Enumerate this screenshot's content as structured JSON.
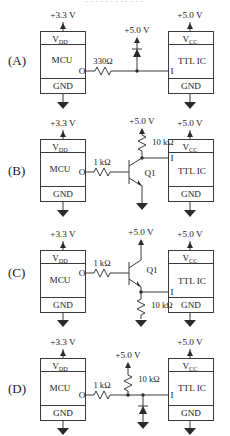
{
  "page": {
    "top_cut_text": "············",
    "background": "#ffffff",
    "ink": "#2a2a2a"
  },
  "labels": {
    "mcu": "MCU",
    "ttl": "TTL IC",
    "vdd": "V",
    "vdd_sub": "DD",
    "vcc": "V",
    "vcc_sub": "CC",
    "gnd": "GND",
    "out_pin": "O",
    "in_pin": "I",
    "v33": "+3.3 V",
    "v50": "+5.0 V",
    "q1": "Q1",
    "r330": "330Ω",
    "r1k": "1 kΩ",
    "r10k": "10 kΩ"
  },
  "circuits": [
    {
      "id": "A",
      "tag": "(A)",
      "mcu_supply": "+3.3 V",
      "mid_supply": "+5.0 V",
      "ttl_supply": "+5.0 V",
      "components": [
        "330Ω series resistor",
        "clamp diode to +5.0 V"
      ],
      "series_resistor": "330Ω",
      "pullup_resistor": "",
      "has_transistor": false,
      "has_diode": true,
      "diode_direction": "up"
    },
    {
      "id": "B",
      "tag": "(B)",
      "mcu_supply": "+3.3 V",
      "mid_supply": "+5.0 V",
      "ttl_supply": "+5.0 V",
      "components": [
        "1 kΩ base resistor",
        "NPN transistor Q1",
        "10 kΩ pull-up"
      ],
      "series_resistor": "1 kΩ",
      "pullup_resistor": "10 kΩ",
      "transistor": "Q1",
      "has_transistor": true,
      "has_diode": false,
      "topology": "common-emitter inverter"
    },
    {
      "id": "C",
      "tag": "(C)",
      "mcu_supply": "+3.3 V",
      "mid_supply": "+5.0 V",
      "ttl_supply": "+5.0 V",
      "components": [
        "1 kΩ base resistor",
        "NPN transistor Q1",
        "10 kΩ emitter resistor"
      ],
      "series_resistor": "1 kΩ",
      "pulldown_resistor": "10 kΩ",
      "transistor": "Q1",
      "has_transistor": true,
      "has_diode": false,
      "topology": "emitter follower"
    },
    {
      "id": "D",
      "tag": "(D)",
      "mcu_supply": "+3.3 V",
      "mid_supply": "+5.0 V",
      "ttl_supply": "+5.0 V",
      "components": [
        "1 kΩ series resistor",
        "10 kΩ pull-up to +5.0 V",
        "diode to ground"
      ],
      "series_resistor": "1 kΩ",
      "pullup_resistor": "10 kΩ",
      "has_transistor": false,
      "has_diode": true,
      "diode_direction": "up-from-ground"
    }
  ]
}
